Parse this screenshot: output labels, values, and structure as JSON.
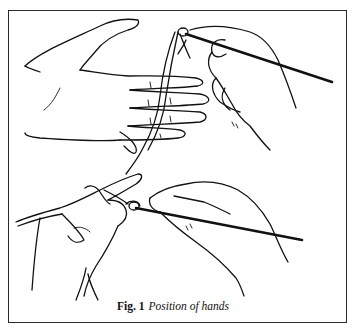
{
  "figure": {
    "label": "Fig. 1",
    "title": "Position of hands",
    "illustrations": [
      {
        "name": "top-panel",
        "description": "left hand with yarn wound around fingers, right hand holding crochet hook"
      },
      {
        "name": "bottom-panel",
        "description": "both hands working a crochet stitch with hook and yarn"
      }
    ],
    "colors": {
      "line": "#111111",
      "background": "#ffffff",
      "border": "#2a2a2a"
    }
  }
}
